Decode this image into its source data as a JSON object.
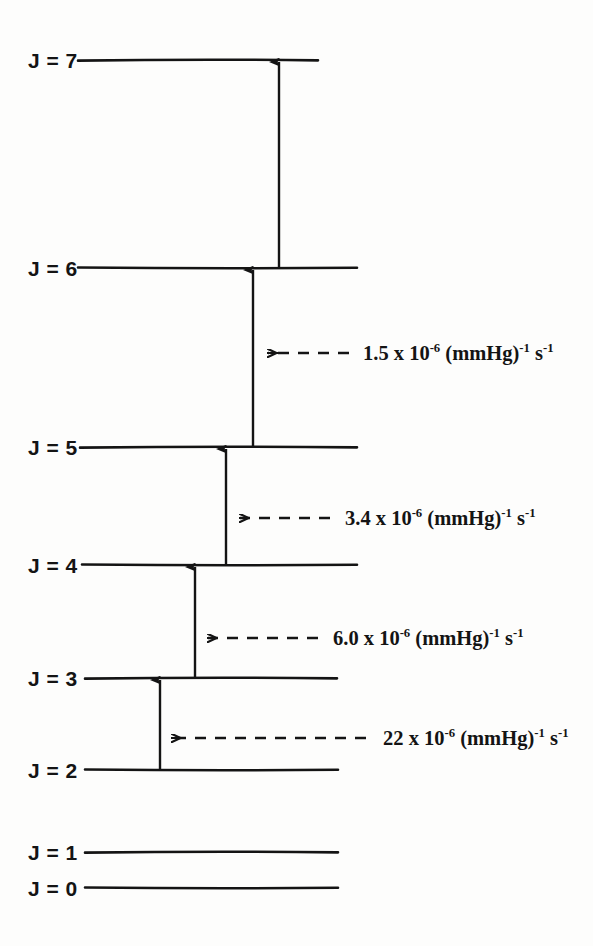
{
  "figure": {
    "type": "energy-level-diagram",
    "title": "",
    "background_color": "#fdfdfc",
    "ink_color": "#141414"
  },
  "levels": [
    {
      "label": "J = 7",
      "j": 7,
      "y": 60,
      "line_start_x": 78,
      "line_end_x": 318
    },
    {
      "label": "J = 6",
      "j": 6,
      "y": 268,
      "line_start_x": 78,
      "line_end_x": 357
    },
    {
      "label": "J = 5",
      "j": 5,
      "y": 447,
      "line_start_x": 80,
      "line_end_x": 357
    },
    {
      "label": "J = 4",
      "j": 4,
      "y": 565,
      "line_start_x": 82,
      "line_end_x": 357
    },
    {
      "label": "J = 3",
      "j": 3,
      "y": 678,
      "line_start_x": 85,
      "line_end_x": 337
    },
    {
      "label": "J = 2",
      "j": 2,
      "y": 770,
      "line_start_x": 85,
      "line_end_x": 338
    },
    {
      "label": "J = 1",
      "j": 1,
      "y": 852,
      "line_start_x": 85,
      "line_end_x": 338
    },
    {
      "label": "J = 0",
      "j": 0,
      "y": 888,
      "line_start_x": 85,
      "line_end_x": 338
    }
  ],
  "label_column_x": 28,
  "transitions": [
    {
      "name": "transition-2-to-3",
      "from_j": 2,
      "to_j": 3,
      "x": 160,
      "y_from": 770,
      "y_to": 680
    },
    {
      "name": "transition-3-to-4",
      "from_j": 3,
      "to_j": 4,
      "x": 195,
      "y_from": 678,
      "y_to": 567
    },
    {
      "name": "transition-4-to-5",
      "from_j": 4,
      "to_j": 5,
      "x": 226,
      "y_from": 565,
      "y_to": 449
    },
    {
      "name": "transition-5-to-6",
      "from_j": 5,
      "to_j": 6,
      "x": 253,
      "y_from": 447,
      "y_to": 270
    },
    {
      "name": "transition-6-to-7",
      "from_j": 6,
      "to_j": 7,
      "x": 279,
      "y_from": 268,
      "y_to": 62
    }
  ],
  "rate_annotations": [
    {
      "name": "rate-5-to-6",
      "coefficient": "1.5",
      "exponent": "-6",
      "units_base": "(mmHg)",
      "units_exp1": "-1",
      "units_second": "s",
      "units_exp2": "-1",
      "text": "1.5 x 10-6 (mmHg)-1 s-1",
      "y": 353,
      "arrow_tail_x": 349,
      "arrow_head_x": 268,
      "text_x": 363
    },
    {
      "name": "rate-4-to-5",
      "coefficient": "3.4",
      "exponent": "-6",
      "units_base": "(mmHg)",
      "units_exp1": "-1",
      "units_second": "s",
      "units_exp2": "-1",
      "text": "3.4 x 10-6 (mmHg)-1 s-1",
      "y": 518,
      "arrow_tail_x": 330,
      "arrow_head_x": 240,
      "text_x": 345
    },
    {
      "name": "rate-3-to-4",
      "coefficient": "6.0",
      "exponent": "-6",
      "units_base": "(mmHg)",
      "units_exp1": "-1",
      "units_second": "s",
      "units_exp2": "-1",
      "text": "6.0 x 10-6 (mmHg)-1 s-1",
      "y": 638,
      "arrow_tail_x": 318,
      "arrow_head_x": 208,
      "text_x": 333
    },
    {
      "name": "rate-2-to-3",
      "coefficient": "22",
      "exponent": "-6",
      "units_base": "(mmHg)",
      "units_exp1": "-1",
      "units_second": "s",
      "units_exp2": "-1",
      "text": "22 x 10-6 (mmHg)-1 s-1",
      "y": 738,
      "arrow_tail_x": 366,
      "arrow_head_x": 172,
      "text_x": 383
    }
  ]
}
